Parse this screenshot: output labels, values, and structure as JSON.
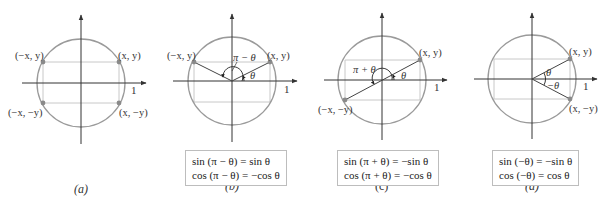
{
  "figure": {
    "colors": {
      "circle": "#9a9a9a",
      "rect_lines": "#c8c8c8",
      "axes": "#333333",
      "radius_lines": "#444444",
      "points": "#8a8a8a",
      "box_border": "#bdbdbd"
    },
    "panels": [
      {
        "id": "a",
        "caption": "(a)",
        "points": [
          {
            "label": "(−x, y)"
          },
          {
            "label": "(x, y)"
          },
          {
            "label": "(−x, −y)"
          },
          {
            "label": "(x, −y)"
          }
        ],
        "axis_tick_label": "1",
        "angle_labels": [],
        "identities": []
      },
      {
        "id": "b",
        "caption": "(b)",
        "points": [
          {
            "label": "(−x, y)"
          },
          {
            "label": "(x, y)"
          }
        ],
        "axis_tick_label": "1",
        "angle_labels": [
          "π − θ",
          "θ"
        ],
        "identities": [
          "sin (π − θ) = sin θ",
          "cos (π − θ) = −cos θ"
        ]
      },
      {
        "id": "c",
        "caption": "(c)",
        "points": [
          {
            "label": "(x, y)"
          },
          {
            "label": "(−x, −y)"
          }
        ],
        "axis_tick_label": "1",
        "angle_labels": [
          "π + θ",
          "θ"
        ],
        "identities": [
          "sin (π + θ) = −sin θ",
          "cos (π + θ) = −cos θ"
        ]
      },
      {
        "id": "d",
        "caption": "(d)",
        "points": [
          {
            "label": "(x, y)"
          },
          {
            "label": "(x, −y)"
          }
        ],
        "axis_tick_label": "1",
        "angle_labels": [
          "θ",
          "−θ"
        ],
        "identities": [
          "sin (−θ) = −sin θ",
          "cos (−θ) = cos θ"
        ]
      }
    ]
  }
}
